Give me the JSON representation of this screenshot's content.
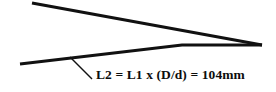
{
  "figure": {
    "background_color": "#ffffff",
    "stroke_color": "#111111",
    "width": 276,
    "height": 92
  },
  "diagram": {
    "type": "line-drawing",
    "elements": [
      {
        "name": "upper-ray",
        "kind": "line",
        "stroke_width": 3.2,
        "points": [
          [
            32,
            3
          ],
          [
            262,
            45
          ]
        ]
      },
      {
        "name": "lower-ray",
        "kind": "polyline",
        "stroke_width": 3.0,
        "points": [
          [
            20,
            64
          ],
          [
            182,
            45
          ],
          [
            262,
            45
          ]
        ]
      },
      {
        "name": "leader-line",
        "kind": "line",
        "stroke_width": 1.5,
        "points": [
          [
            70,
            57
          ],
          [
            92,
            79
          ]
        ]
      }
    ]
  },
  "annotation": {
    "label": "L2 = L1 x (D/d) = 104mm",
    "variable": "L2",
    "formula": "L1 x (D/d)",
    "value": "104",
    "unit": "mm",
    "color": "#0d0d0d"
  }
}
